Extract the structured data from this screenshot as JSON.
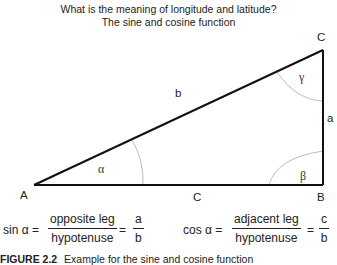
{
  "title": {
    "line1": "What is the meaning of longitude and latitude?",
    "line2": "The sine and cosine function"
  },
  "diagram": {
    "vertices": {
      "A": "A",
      "B": "B",
      "C": "C"
    },
    "sides": {
      "a": "a",
      "b": "b",
      "c": "C"
    },
    "angles": {
      "alpha": "α",
      "beta": "β",
      "gamma": "γ"
    }
  },
  "formulas": {
    "sine": {
      "lhs": "sin α =",
      "numerator": "opposite leg",
      "denominator": "hypotenuse",
      "equals": "=",
      "result_num": "a",
      "result_den": "b"
    },
    "cosine": {
      "lhs": "cos α =",
      "numerator": "adjacent leg",
      "denominator": "hypotenuse",
      "equals": "=",
      "result_num": "c",
      "result_den": "b"
    }
  },
  "caption": {
    "label": "FIGURE 2.2",
    "text": "Example for the sine and cosine function"
  }
}
